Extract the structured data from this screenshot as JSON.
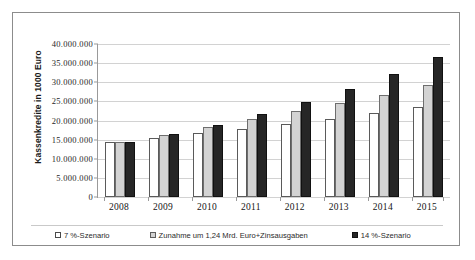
{
  "chart_data": {
    "type": "bar",
    "title": "",
    "subtitle": "",
    "xlabel": "",
    "ylabel": "Kassenkredite in 1000 Euro",
    "categories": [
      "2008",
      "2009",
      "2010",
      "2011",
      "2012",
      "2013",
      "2014",
      "2015"
    ],
    "ylim": [
      0,
      40000000
    ],
    "ytick_labels": [
      "40.000.000",
      "35.000.000",
      "30.000.000",
      "25.000.000",
      "20.000.000",
      "15.000.000",
      "10.000.000",
      "5.000.000",
      "0"
    ],
    "ytick_values": [
      40000000,
      35000000,
      30000000,
      25000000,
      20000000,
      15000000,
      10000000,
      5000000,
      0
    ],
    "grid": true,
    "legend_position": "bottom",
    "series": [
      {
        "name": "7 %-Szenario",
        "color": "#ffffff",
        "values": [
          14400000,
          15400000,
          16700000,
          17800000,
          19200000,
          20500000,
          22000000,
          23600000
        ]
      },
      {
        "name": "Zunahme um 1,24 Mrd. Euro+Zinsausgaben",
        "color": "#d3d3d3",
        "values": [
          14400000,
          16300000,
          18200000,
          20300000,
          22400000,
          24500000,
          26700000,
          29200000
        ]
      },
      {
        "name": "14 %-Szenario",
        "color": "#262626",
        "values": [
          14400000,
          16500000,
          18900000,
          21700000,
          24800000,
          28200000,
          32100000,
          36600000
        ]
      }
    ]
  }
}
